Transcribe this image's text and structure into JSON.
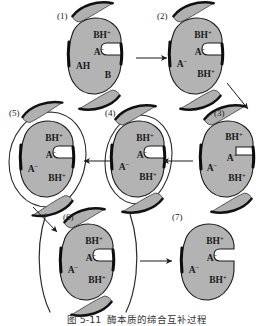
{
  "figure": {
    "type": "mechanism-diagram",
    "background_color": "#ffffff",
    "body_fill": "#b3b3b3",
    "body_stroke": "#1a1a1a",
    "shell_fill": "#ffffff",
    "shell_stroke": "#2b2b2b",
    "wing_fill": "#b0b0b0",
    "wing_edge_dark": "#111111",
    "arrow_color": "#1a1a1a",
    "label_color": "#222222"
  },
  "steps": [
    {
      "id": "1",
      "label": "(1)",
      "has_shell": false,
      "has_wings": true,
      "notch": "round",
      "residues": [
        {
          "name": "residue-top",
          "text": "BH",
          "sup": "+"
        },
        {
          "name": "residue-notch",
          "text": "A",
          "sup": "−"
        },
        {
          "name": "residue-left",
          "text": "AH",
          "sup": ""
        },
        {
          "name": "residue-bottom",
          "text": "B",
          "sup": ""
        }
      ]
    },
    {
      "id": "2",
      "label": "(2)",
      "has_shell": false,
      "has_wings": true,
      "notch": "round",
      "residues": [
        {
          "name": "residue-top",
          "text": "BH",
          "sup": "+"
        },
        {
          "name": "residue-notch",
          "text": "A",
          "sup": "−"
        },
        {
          "name": "residue-left",
          "text": "A",
          "sup": "−"
        },
        {
          "name": "residue-bottom",
          "text": "BH",
          "sup": "+"
        }
      ]
    },
    {
      "id": "3",
      "label": "(3)",
      "has_shell": false,
      "has_wings": true,
      "notch": "slot",
      "residues": [
        {
          "name": "residue-top",
          "text": "BH",
          "sup": "+"
        },
        {
          "name": "residue-notch",
          "text": "A",
          "sup": "−"
        },
        {
          "name": "residue-left",
          "text": "A",
          "sup": "−"
        },
        {
          "name": "residue-bottom",
          "text": "BH",
          "sup": "+"
        }
      ]
    },
    {
      "id": "4",
      "label": "(4)",
      "has_shell": true,
      "shell_gap": "narrow",
      "has_wings": true,
      "notch": "round",
      "residues": [
        {
          "name": "residue-top",
          "text": "BH",
          "sup": "+"
        },
        {
          "name": "residue-notch",
          "text": "A",
          "sup": "−"
        },
        {
          "name": "residue-left",
          "text": "A",
          "sup": "−"
        },
        {
          "name": "residue-bottom",
          "text": "BH",
          "sup": "+"
        }
      ]
    },
    {
      "id": "5",
      "label": "(5)",
      "has_shell": true,
      "shell_gap": "wide",
      "has_wings": true,
      "notch": "round",
      "residues": [
        {
          "name": "residue-top",
          "text": "BH",
          "sup": "+"
        },
        {
          "name": "residue-notch",
          "text": "A",
          "sup": "−"
        },
        {
          "name": "residue-left",
          "text": "A",
          "sup": "−"
        },
        {
          "name": "residue-bottom",
          "text": "BH",
          "sup": "+"
        }
      ]
    },
    {
      "id": "6",
      "label": "(6)",
      "has_shell": true,
      "shell_gap": "detached",
      "has_wings": true,
      "notch": "round",
      "residues": [
        {
          "name": "residue-top",
          "text": "BH",
          "sup": "+"
        },
        {
          "name": "residue-notch",
          "text": "A",
          "sup": "−"
        },
        {
          "name": "residue-left",
          "text": "A",
          "sup": "−"
        },
        {
          "name": "residue-bottom",
          "text": "BH",
          "sup": "+"
        }
      ]
    },
    {
      "id": "7",
      "label": "(7)",
      "has_shell": false,
      "has_wings": false,
      "notch": "round",
      "residues": [
        {
          "name": "residue-top",
          "text": "BH",
          "sup": "+"
        },
        {
          "name": "residue-notch",
          "text": "A",
          "sup": "−"
        },
        {
          "name": "residue-left",
          "text": "A",
          "sup": "−"
        },
        {
          "name": "residue-bottom",
          "text": "BH",
          "sup": "+"
        }
      ]
    }
  ],
  "arrows": [
    {
      "name": "arrow-1-to-2",
      "direction": "right"
    },
    {
      "name": "arrow-2-to-3",
      "direction": "down-right"
    },
    {
      "name": "arrow-3-to-4",
      "direction": "left"
    },
    {
      "name": "arrow-4-to-5",
      "direction": "left"
    },
    {
      "name": "arrow-5-to-6",
      "direction": "down-right"
    },
    {
      "name": "arrow-6-to-7",
      "direction": "right"
    }
  ],
  "caption": {
    "number": "图 5-11",
    "text": "酶本质的缔合互补过程"
  }
}
